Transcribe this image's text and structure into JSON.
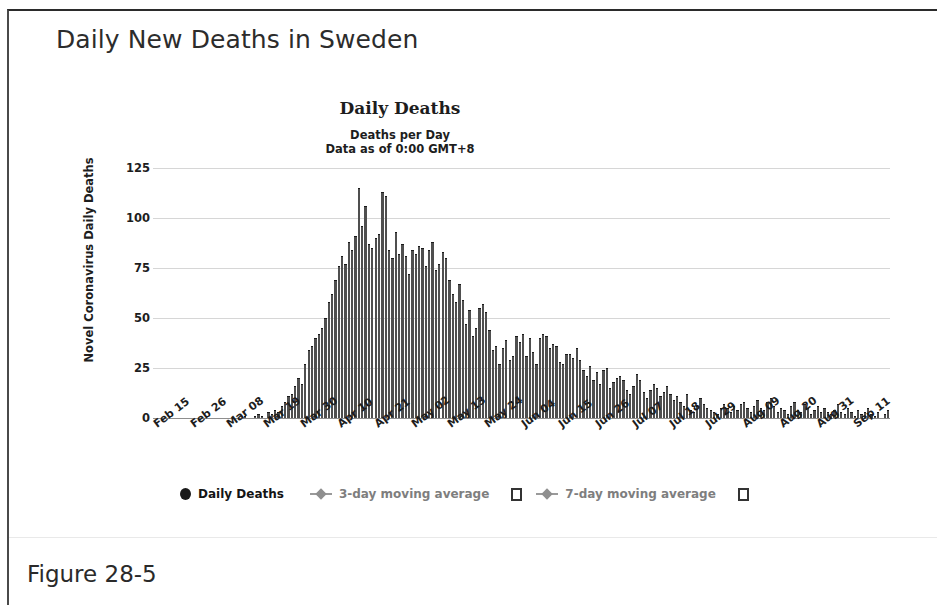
{
  "page": {
    "heading": "Daily New Deaths in Sweden",
    "figure_caption": "Figure 28-5"
  },
  "legend": {
    "items": [
      {
        "label": "Daily Deaths",
        "marker": "filled-dot",
        "style": "primary"
      },
      {
        "label": "3-day moving average",
        "marker": "line-diamond",
        "style": "muted",
        "checkbox": true
      },
      {
        "label": "7-day moving average",
        "marker": "line-diamond",
        "style": "muted",
        "checkbox": true
      }
    ]
  },
  "chart_data": {
    "type": "bar",
    "title": "Daily Deaths",
    "subtitle_line1": "Deaths per Day",
    "subtitle_line2": "Data as of 0:00 GMT+8",
    "xlabel": "",
    "ylabel": "Novel Coronavirus Daily Deaths",
    "ylim": [
      0,
      125
    ],
    "yticks": [
      0,
      25,
      50,
      75,
      100,
      125
    ],
    "ytick_labels": [
      "0",
      "25",
      "50",
      "75",
      "100",
      "125"
    ],
    "grid": true,
    "legend_position": "bottom",
    "xtick_labels": [
      "Feb 15",
      "Feb 26",
      "Mar 08",
      "Mar 19",
      "Mar 30",
      "Apr 10",
      "Apr 21",
      "May 02",
      "May 13",
      "May 24",
      "Jun 04",
      "Jun 15",
      "Jun 26",
      "Jul 07",
      "Jul 18",
      "Jul 29",
      "Aug 09",
      "Aug 20",
      "Aug 31",
      "Sep 11"
    ],
    "xtick_indices": [
      0,
      11,
      22,
      33,
      44,
      55,
      66,
      77,
      88,
      99,
      110,
      121,
      132,
      143,
      154,
      165,
      176,
      187,
      198,
      209
    ],
    "series": [
      {
        "name": "Daily Deaths",
        "color": "#4f4f4f",
        "values": [
          0,
          0,
          0,
          0,
          0,
          0,
          0,
          0,
          0,
          0,
          0,
          0,
          0,
          0,
          0,
          0,
          0,
          0,
          0,
          0,
          0,
          0,
          0,
          0,
          0,
          0,
          0,
          1,
          0,
          0,
          1,
          2,
          1,
          0,
          3,
          2,
          4,
          3,
          6,
          8,
          11,
          12,
          16,
          20,
          17,
          27,
          34,
          36,
          40,
          42,
          45,
          50,
          58,
          62,
          69,
          76,
          81,
          77,
          88,
          84,
          91,
          115,
          96,
          106,
          87,
          85,
          90,
          92,
          113,
          111,
          84,
          80,
          93,
          82,
          87,
          81,
          72,
          84,
          82,
          86,
          85,
          76,
          84,
          88,
          74,
          77,
          83,
          80,
          69,
          62,
          58,
          67,
          59,
          47,
          54,
          41,
          45,
          55,
          57,
          53,
          44,
          34,
          36,
          27,
          35,
          39,
          29,
          31,
          41,
          38,
          42,
          31,
          40,
          33,
          27,
          40,
          42,
          41,
          35,
          37,
          36,
          28,
          27,
          32,
          32,
          30,
          35,
          29,
          24,
          21,
          26,
          19,
          23,
          17,
          24,
          25,
          15,
          18,
          20,
          21,
          19,
          14,
          12,
          16,
          22,
          19,
          13,
          10,
          14,
          17,
          15,
          11,
          13,
          16,
          12,
          9,
          11,
          8,
          6,
          12,
          4,
          3,
          6,
          10,
          7,
          5,
          4,
          3,
          2,
          5,
          7,
          5,
          3,
          6,
          4,
          7,
          8,
          5,
          3,
          6,
          9,
          5,
          4,
          8,
          10,
          6,
          3,
          5,
          4,
          2,
          6,
          8,
          4,
          3,
          7,
          5,
          2,
          4,
          6,
          3,
          5,
          3,
          2,
          4,
          7,
          3,
          2,
          5,
          3,
          1,
          4,
          2,
          3,
          5,
          2,
          1,
          3,
          0,
          2,
          4
        ]
      }
    ]
  }
}
